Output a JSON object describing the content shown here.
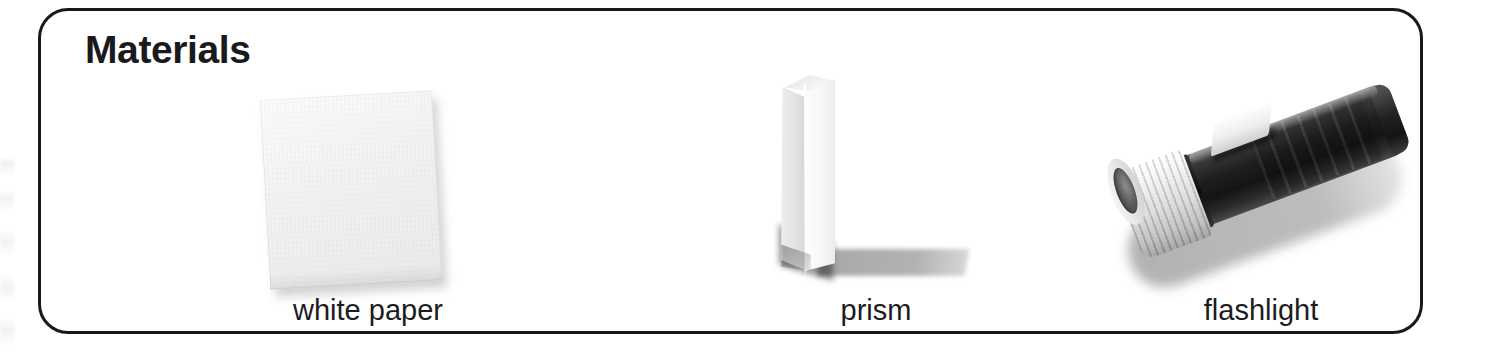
{
  "panel": {
    "title": "Materials",
    "border_color": "#19191b",
    "background_color": "#ffffff"
  },
  "items": [
    {
      "id": "white-paper",
      "label": "white paper",
      "figure_name": "white-paper-image",
      "description": "a rectangular sheet of white paper, tilted slightly counter-clockwise, with a soft drop shadow"
    },
    {
      "id": "prism",
      "label": "prism",
      "figure_name": "prism-image",
      "description": "a clear triangular glass prism standing upright, casting a shadow to the right"
    },
    {
      "id": "flashlight",
      "label": "flashlight",
      "figure_name": "flashlight-image",
      "description": "a flashlight with a dark ribbed barrel, a white ribbed lens bezel pointing to the lower-left, and a white slide switch"
    }
  ]
}
